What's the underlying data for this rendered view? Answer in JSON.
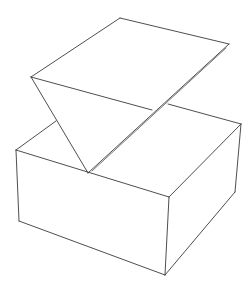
{
  "figure": {
    "stroke_color": "#3a3a3a",
    "background": "#ffffff",
    "shapes": [
      {
        "name": "wedge",
        "kind": "inverted triangular prism"
      },
      {
        "name": "box",
        "kind": "rectangular cuboid"
      }
    ]
  }
}
